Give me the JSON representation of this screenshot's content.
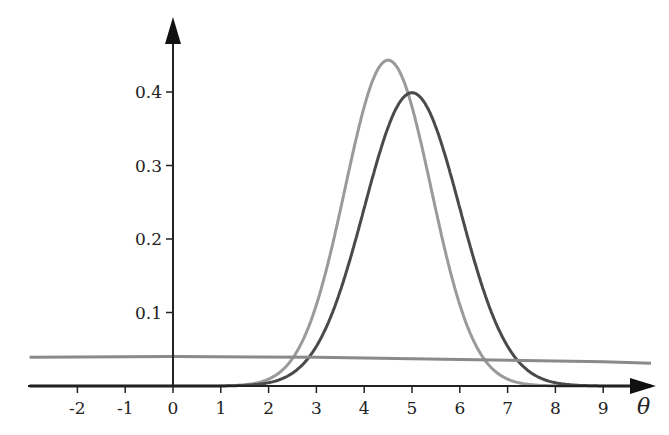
{
  "chart_data": {
    "type": "line",
    "title": "",
    "xlabel": "θ",
    "ylabel": "",
    "xlim": [
      -3,
      10
    ],
    "ylim": [
      0,
      0.48
    ],
    "grid": false,
    "legend": null,
    "x_ticks": [
      "-2",
      "-1",
      "0",
      "1",
      "2",
      "3",
      "4",
      "5",
      "6",
      "7",
      "8",
      "9"
    ],
    "y_ticks": [
      "0.1",
      "0.2",
      "0.3",
      "0.4"
    ],
    "series": [
      {
        "name": "light-gray-density",
        "description": "Normal density, mean ≈ 4.5, sd ≈ 0.9, peak ≈ 0.44",
        "color": "#9a9a9a",
        "mean": 4.5,
        "sd": 0.9,
        "peak": 0.443
      },
      {
        "name": "dark-gray-density",
        "description": "Normal density, mean 5, sd 1, peak ≈ 0.40",
        "color": "#4a4a4a",
        "mean": 5,
        "sd": 1,
        "peak": 0.399
      },
      {
        "name": "flat-gray-density",
        "description": "Very wide, nearly flat density ≈ 0.04 slowly decreasing",
        "color": "#8a8a8a",
        "x": [
          -3,
          0,
          3,
          6,
          9,
          10
        ],
        "values": [
          0.039,
          0.04,
          0.039,
          0.036,
          0.033,
          0.031
        ]
      }
    ]
  }
}
